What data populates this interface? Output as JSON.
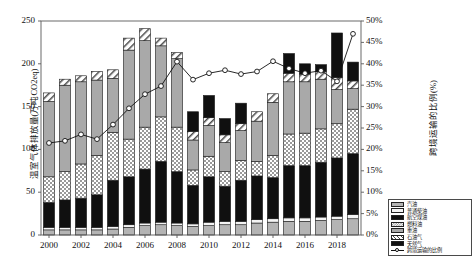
{
  "chart_data": {
    "type": "bar",
    "subtype": "stacked-bar-with-line",
    "title": "",
    "xlabel": "",
    "ylabel": "温室气体排放量(万吨CO2eq)",
    "y2label": "跨境运输的比例(%)",
    "ylim": [
      0,
      250
    ],
    "y2lim": [
      0,
      50
    ],
    "yticks": [
      0,
      50,
      100,
      150,
      200,
      250
    ],
    "ytick_labels": [
      "0",
      "50",
      "100",
      "150",
      "200",
      "250"
    ],
    "y2ticks": [
      0,
      5,
      10,
      15,
      20,
      25,
      30,
      35,
      40,
      45,
      50
    ],
    "y2tick_labels": [
      "0%",
      "5%",
      "10%",
      "15%",
      "20%",
      "25%",
      "30%",
      "35%",
      "40%",
      "45%",
      "50%"
    ],
    "grid": false,
    "legend_position": "bottom-right",
    "categories": [
      "2000",
      "2001",
      "2002",
      "2003",
      "2004",
      "2005",
      "2006",
      "2007",
      "2008",
      "2009",
      "2010",
      "2011",
      "2012",
      "2013",
      "2014",
      "2015",
      "2016",
      "2017",
      "2018",
      "2019"
    ],
    "x": [
      "2000",
      "2001",
      "2002",
      "2003",
      "2004",
      "2005",
      "2006",
      "2007",
      "2008",
      "2009",
      "2010",
      "2011",
      "2012",
      "2013",
      "2014",
      "2015",
      "2016",
      "2017",
      "2018",
      "2019"
    ],
    "xtick_labels": [
      "2000",
      "2002",
      "2004",
      "2006",
      "2008",
      "2010",
      "2012",
      "2014",
      "2016",
      "2018"
    ],
    "series": [
      {
        "name": "汽油",
        "pattern": "light-gray-solid",
        "color": "#b0b0b0",
        "values": [
          6,
          6,
          6,
          6,
          7,
          9,
          11,
          12,
          11,
          10,
          11,
          12,
          12,
          14,
          15,
          16,
          16,
          17,
          18,
          19
        ]
      },
      {
        "name": "普通柴油",
        "pattern": "white-solid",
        "color": "#f2f2f2",
        "values": [
          3,
          3,
          3,
          3,
          3,
          3,
          3,
          3,
          3,
          3,
          4,
          4,
          4,
          4,
          4,
          4,
          4,
          4,
          4,
          5
        ]
      },
      {
        "name": "航空煤油",
        "pattern": "black-solid",
        "color": "#101010",
        "values": [
          29,
          32,
          34,
          38,
          54,
          56,
          63,
          71,
          60,
          45,
          53,
          41,
          48,
          51,
          48,
          61,
          61,
          64,
          68,
          71
        ]
      },
      {
        "name": "燃料油",
        "pattern": "checkerboard",
        "color": "#d8d8d8",
        "values": [
          30,
          33,
          40,
          46,
          56,
          44,
          49,
          52,
          52,
          18,
          24,
          17,
          23,
          17,
          26,
          37,
          38,
          39,
          40,
          52
        ]
      },
      {
        "name": "重油",
        "pattern": "medium-gray-solid",
        "color": "#a8a8a8",
        "values": [
          88,
          101,
          96,
          88,
          63,
          104,
          101,
          83,
          80,
          35,
          36,
          34,
          35,
          47,
          62,
          61,
          60,
          58,
          40,
          24
        ]
      },
      {
        "name": "石油气",
        "pattern": "diagonal-hatch",
        "color": "#ececec",
        "values": [
          10,
          7,
          7,
          10,
          10,
          14,
          14,
          9,
          7,
          10,
          9,
          9,
          8,
          11,
          10,
          10,
          9,
          9,
          14,
          9
        ]
      },
      {
        "name": "天然气",
        "pattern": "black-solid",
        "color": "#101010",
        "values": [
          0,
          0,
          0,
          0,
          0,
          0,
          0,
          0,
          0,
          23,
          26,
          19,
          24,
          0,
          0,
          23,
          12,
          8,
          52,
          22
        ]
      }
    ],
    "line_series": {
      "name": "跨境运输的比例",
      "axis": "right",
      "marker": "open-circle",
      "color": "#111111",
      "values": [
        21.5,
        22.0,
        23.5,
        22.4,
        25.8,
        29.6,
        32.9,
        34.8,
        40.5,
        36.3,
        37.8,
        38.5,
        37.6,
        38.2,
        40.6,
        38.9,
        37.8,
        38.4,
        35.9,
        47.0
      ]
    },
    "bar_totals": [
      166,
      182,
      186,
      191,
      193,
      230,
      241,
      230,
      213,
      144,
      163,
      136,
      154,
      144,
      165,
      212,
      200,
      199,
      236,
      202
    ]
  },
  "legend": {
    "items": [
      {
        "label": "汽油",
        "pattern": "light-gray-solid"
      },
      {
        "label": "普通柴油",
        "pattern": "white-solid"
      },
      {
        "label": "航空煤油",
        "pattern": "black-solid"
      },
      {
        "label": "燃料油",
        "pattern": "checkerboard"
      },
      {
        "label": "重油",
        "pattern": "medium-gray-solid"
      },
      {
        "label": "石油气",
        "pattern": "diagonal-hatch"
      },
      {
        "label": "天然气",
        "pattern": "black-solid"
      },
      {
        "label": "跨境运输的比例",
        "pattern": "line-marker"
      }
    ]
  }
}
